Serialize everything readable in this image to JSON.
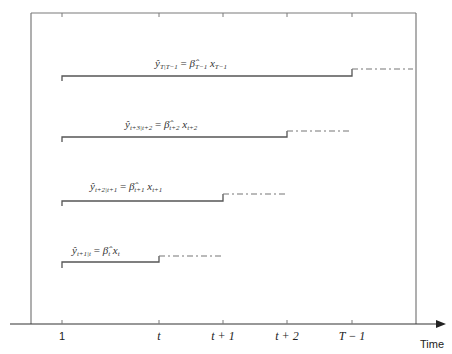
{
  "diagram": {
    "title": "",
    "x_axis": {
      "label": "Time",
      "ticks": [
        {
          "label": "1",
          "x": 62,
          "italic": false
        },
        {
          "label": "t",
          "x": 159,
          "italic": true
        },
        {
          "label": "t + 1",
          "x": 223,
          "italic": true
        },
        {
          "label": "t + 2",
          "x": 287,
          "italic": true
        },
        {
          "label": "T − 1",
          "x": 352,
          "italic": true
        }
      ]
    },
    "rows": [
      {
        "equation": "ŷT|T−1 = β̂T−1 xT−1",
        "solid_y": 76,
        "start_x": 62,
        "end_x": 352,
        "dash_y": 69,
        "dash_end_x": 413
      },
      {
        "equation": "ŷt+3|t+2 = β̂t+2 xt+2",
        "solid_y": 137,
        "start_x": 62,
        "end_x": 287,
        "dash_y": 131,
        "dash_end_x": 350
      },
      {
        "equation": "ŷt+2|t+1 = β̂t+1 xt+1",
        "solid_y": 201,
        "start_x": 62,
        "end_x": 223,
        "dash_y": 194,
        "dash_end_x": 287
      },
      {
        "equation": "ŷt+1|t = β̂t xt",
        "solid_y": 262,
        "start_x": 62,
        "end_x": 159,
        "dash_y": 256,
        "dash_end_x": 222
      }
    ]
  },
  "labels": {
    "row1": {
      "y": "ŷ",
      "ysub": "T|T−1",
      "eq": " = ",
      "b": "β̂",
      "bsub": "T−1",
      "x": " x",
      "xsub": "T−1"
    },
    "row2": {
      "y": "ŷ",
      "ysub": "t+3|t+2",
      "eq": " = ",
      "b": "β̂",
      "bsub": "t+2",
      "x": " x",
      "xsub": "t+2"
    },
    "row3": {
      "y": "ŷ",
      "ysub": "t+2|t+1",
      "eq": " = ",
      "b": "β̂",
      "bsub": "t+1",
      "x": " x",
      "xsub": "t+1"
    },
    "row4": {
      "y": "ŷ",
      "ysub": "t+1|t",
      "eq": " = ",
      "b": "β̂",
      "bsub": "t",
      "x": " x",
      "xsub": "t"
    }
  },
  "ticks": {
    "t1": "1",
    "t2": "t",
    "t3": "t + 1",
    "t4": "t + 2",
    "t5": "T − 1",
    "axis": "Time"
  }
}
